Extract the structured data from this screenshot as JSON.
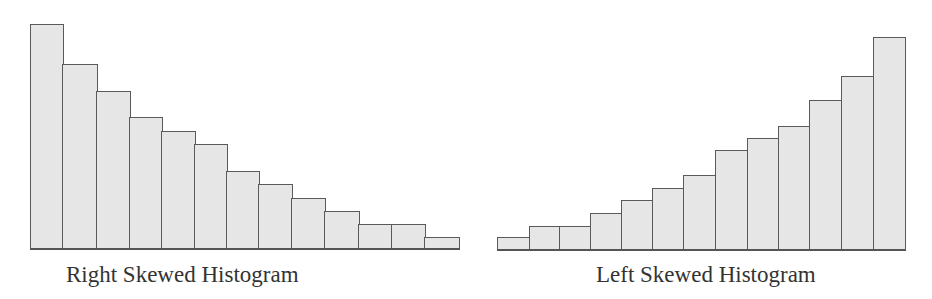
{
  "chart_data": [
    {
      "type": "bar",
      "title": "Right Skewed Histogram",
      "xlabel": "",
      "ylabel": "",
      "grid": false,
      "categories": [
        "1",
        "2",
        "3",
        "4",
        "5",
        "6",
        "7",
        "8",
        "9",
        "10",
        "11",
        "12",
        "13"
      ],
      "values": [
        17,
        14,
        12,
        10,
        9,
        8,
        6,
        5,
        4,
        3,
        2,
        2,
        1
      ],
      "ylim": [
        0,
        17
      ],
      "layout": {
        "baseline_y": 248,
        "unit_px": 13.2,
        "edges_x": [
          30,
          62,
          96,
          129,
          161,
          194,
          226,
          258,
          291,
          324,
          358,
          391,
          424,
          458
        ],
        "heights_px": [
          224,
          184,
          157,
          131,
          117,
          104,
          77,
          64,
          50,
          37,
          24,
          24,
          11
        ],
        "label_x": 66,
        "label_y": 263
      }
    },
    {
      "type": "bar",
      "title": "Left Skewed Histogram",
      "xlabel": "",
      "ylabel": "",
      "grid": false,
      "categories": [
        "1",
        "2",
        "3",
        "4",
        "5",
        "6",
        "7",
        "8",
        "9",
        "10",
        "11",
        "12",
        "13"
      ],
      "values": [
        1,
        2,
        2,
        3,
        4,
        5,
        6,
        8,
        9,
        10,
        12,
        14,
        17
      ],
      "ylim": [
        0,
        17
      ],
      "layout": {
        "baseline_y": 249,
        "unit_px": 12.5,
        "edges_x": [
          497,
          529,
          559,
          590,
          621,
          652,
          683,
          715,
          747,
          778,
          809,
          841,
          873,
          904
        ],
        "heights_px": [
          12,
          23,
          23,
          36,
          49,
          61,
          74,
          99,
          111,
          123,
          149,
          173,
          212
        ],
        "label_x": 596,
        "label_y": 263
      }
    }
  ],
  "colors": {
    "bar_fill": "#e6e6e6",
    "bar_stroke": "#5a5a5a",
    "text": "#333333",
    "background": "#ffffff"
  }
}
